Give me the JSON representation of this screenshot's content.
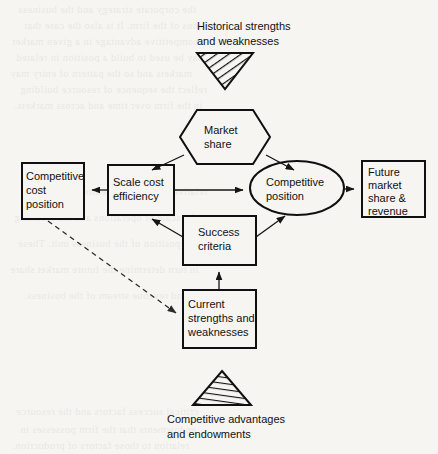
{
  "page": {
    "background_color": "#f6f5f2",
    "ink_color": "#101010"
  },
  "diagram": {
    "title_top": {
      "line1": "Historical strengths",
      "line2": "and weaknesses"
    },
    "title_bottom": {
      "line1": "Competitive advantages",
      "line2": "and endowments"
    },
    "nodes": {
      "market_share": {
        "line1": "Market",
        "line2": "share",
        "shape": "hexagon"
      },
      "scale_cost_efficiency": {
        "line1": "Scale cost",
        "line2": "efficiency",
        "shape": "rectangle"
      },
      "competitive_position": {
        "line1": "Competitive",
        "line2": "position",
        "shape": "ellipse"
      },
      "competitive_cost_position": {
        "line1": "Competitive",
        "line2": "cost",
        "line3": "position",
        "shape": "rectangle"
      },
      "future_market_share": {
        "line1": "Future",
        "line2": "market",
        "line3": "share &",
        "line4": "revenue",
        "shape": "rectangle"
      },
      "success_criteria": {
        "line1": "Success",
        "line2": "criteria",
        "shape": "rectangle"
      },
      "current_strengths": {
        "line1": "Current",
        "line2": "strengths and",
        "line3": "weaknesses",
        "shape": "rectangle"
      }
    },
    "markers": {
      "top_triangle": "hatched-down-triangle",
      "bottom_triangle": "hatched-up-triangle"
    }
  },
  "bleedthrough": {
    "l1": "the corporate strategy and the business",
    "l2": "ions of the firm. It is also the case that",
    "l3": "competitive advantage in a given market",
    "l4": "may be used to build a position in related",
    "l5": "markets and so the pattern of entry may",
    "l6": "reflect the sequence of resource building",
    "l7": "in the firm over time and across markets.",
    "l8": "relative to other competitors and also on",
    "l9": "the scale of operations and the resulting",
    "l10": "cost position of the business unit. These",
    "l11": "in turn determine the future market share",
    "l12": "and revenue stream of the business.",
    "l13": "critical success factors and the resource",
    "l14": "endowments that the firm possesses in",
    "l15": "relation to those factors of production."
  }
}
